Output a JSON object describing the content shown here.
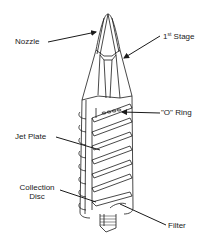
{
  "diagram": {
    "stroke_color": "#1a1a1a",
    "background": "#ffffff",
    "labels": [
      {
        "id": "nozzle",
        "text": "Nozzle"
      },
      {
        "id": "first_stage",
        "text": "1",
        "superscript": "st",
        "suffix": " Stage"
      },
      {
        "id": "o_ring",
        "text": "\"O\" Ring"
      },
      {
        "id": "jet_plate",
        "text": "Jet Plate"
      },
      {
        "id": "collection_disc_line1",
        "text": "Collection"
      },
      {
        "id": "collection_disc_line2",
        "text": "Disc"
      },
      {
        "id": "filter",
        "text": "Filter"
      }
    ]
  }
}
